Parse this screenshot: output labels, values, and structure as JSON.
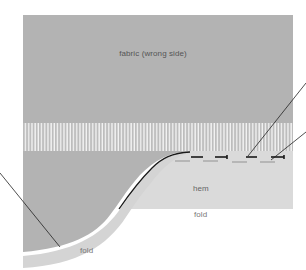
{
  "diagram": {
    "labels": {
      "fabric": "fabric (wrong side)",
      "hem": "hem",
      "fold_hem": "fold",
      "fold_curve": "fold"
    },
    "colors": {
      "fabric": "#b3b3b3",
      "fringe_bar": "#bdbdbd",
      "fringe_gap": "#f4f4f4",
      "hem": "#dadada",
      "fold_band": "#d6d6d6",
      "stitch": "#1a1a1a",
      "leader": "#222222",
      "text": "#5a5a5a"
    },
    "leader_lines": 3,
    "stitches": 4
  }
}
